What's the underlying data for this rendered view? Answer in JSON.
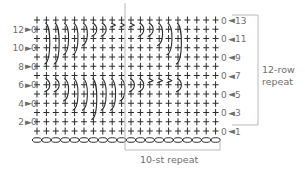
{
  "diagram": {
    "type": "crochet-stitch-chart",
    "stitch_count": 20,
    "row_count": 13,
    "right_row_labels": [
      "13",
      "11",
      "9",
      "7",
      "5",
      "3",
      "1"
    ],
    "left_row_labels": [
      "12",
      "10",
      "8",
      "6",
      "4",
      "2"
    ],
    "row_repeat_label_line1": "12-row",
    "row_repeat_label_line2": "repeat",
    "stitch_repeat_label": "10-st repeat",
    "symbols": {
      "single_crochet": "+",
      "chain": "oval",
      "turning_chain": "0",
      "row_start_arrow": "►",
      "row_end_arrow": "◄",
      "long_stitch": "curved-arc"
    },
    "colors": {
      "stitch": "#2b2b2b",
      "label": "#6e6e6e",
      "bracket": "#b0b0b0"
    }
  }
}
